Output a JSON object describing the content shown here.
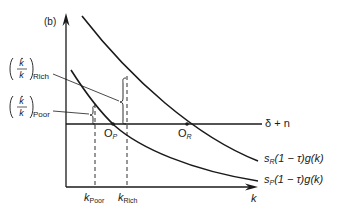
{
  "panel_label": "(b)",
  "axes": {
    "x_label": "k",
    "x_ticks": [
      {
        "base": "k",
        "sub": "Poor"
      },
      {
        "base": "k",
        "sub": "Rich"
      }
    ]
  },
  "curves": {
    "depreciation": {
      "label": "δ + n"
    },
    "rich": {
      "label_base": "s",
      "label_sub": "R",
      "label_rest": "(1 − τ)g(k)"
    },
    "poor": {
      "label_base": "s",
      "label_sub": "P",
      "label_rest": "(1 − τ)g(k)"
    }
  },
  "points": {
    "poor": {
      "base": "O",
      "sub": "P"
    },
    "rich": {
      "base": "O",
      "sub": "R"
    }
  },
  "annotations": {
    "rich_growth": {
      "sub": "Rich"
    },
    "poor_growth": {
      "sub": "Poor"
    }
  },
  "colors": {
    "ink": "#1a1a1a",
    "background": "#ffffff"
  }
}
